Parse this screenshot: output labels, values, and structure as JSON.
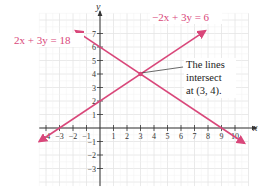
{
  "chart_data": {
    "type": "line",
    "title": "",
    "xlabel": "x",
    "ylabel": "y",
    "xlim": [
      -4.5,
      11
    ],
    "ylim": [
      -4.3,
      8.5
    ],
    "grid": true,
    "x_ticks": [
      -4,
      -3,
      -2,
      -1,
      1,
      2,
      3,
      4,
      5,
      6,
      7,
      8,
      9,
      10
    ],
    "y_ticks": [
      -3,
      -2,
      -1,
      1,
      2,
      3,
      4,
      5,
      6,
      7
    ],
    "series": [
      {
        "name": "2x + 3y = 18",
        "equation": "2x + 3y = 18",
        "slope": -0.6667,
        "intercept": 6,
        "x": [
          -1.8,
          0,
          3,
          9,
          10.7
        ],
        "y": [
          7.2,
          6,
          4,
          0,
          -1.13
        ],
        "color": "#d9477a",
        "label_position": "upper-left"
      },
      {
        "name": "-2x + 3y = 6",
        "equation": "−2x + 3y = 6",
        "slope": 0.6667,
        "intercept": 2,
        "x": [
          -4.5,
          -3,
          0,
          3,
          7.8
        ],
        "y": [
          -1,
          0,
          2,
          4,
          7.2
        ],
        "color": "#d9477a",
        "label_position": "upper-right"
      }
    ],
    "annotations": [
      {
        "text_lines": [
          "The lines",
          "intersect",
          "at (3, 4)."
        ],
        "point": [
          3,
          4
        ]
      }
    ]
  },
  "labels": {
    "x_axis": "x",
    "y_axis": "y",
    "eq1": "2x + 3y = 18",
    "eq2": "−2x + 3y = 6",
    "note_line1": "The lines",
    "note_line2": "intersect",
    "note_line3": "at (3, 4)."
  },
  "colors": {
    "line": "#d9477a",
    "grid": "#e4e4e4",
    "axis": "#333333"
  }
}
